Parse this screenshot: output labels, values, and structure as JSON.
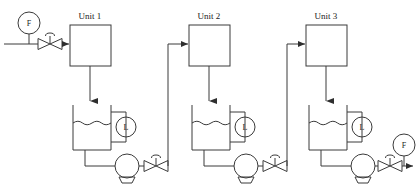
{
  "diagram": {
    "title_labels": [
      "Unit 1",
      "Unit 2",
      "Unit 3"
    ],
    "instrument_tags": {
      "flow_inlet": "F",
      "flow_outlet": "F",
      "level": "L"
    },
    "stroke_color": "#3a3a3a",
    "text_color": "#1a1a1a",
    "background": "#ffffff",
    "stages": [
      {
        "unit_label": "Unit 1",
        "tank_level_tag": "L",
        "has_pump": true,
        "has_discharge_valve": true
      },
      {
        "unit_label": "Unit 2",
        "tank_level_tag": "L",
        "has_pump": true,
        "has_discharge_valve": true
      },
      {
        "unit_label": "Unit 3",
        "tank_level_tag": "L",
        "has_pump": true,
        "has_discharge_valve": true
      }
    ],
    "inlet": {
      "flow_tag": "F",
      "has_control_valve": true
    },
    "outlet": {
      "flow_tag": "F",
      "has_control_valve": true
    }
  }
}
